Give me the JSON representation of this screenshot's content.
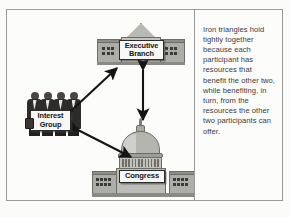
{
  "figure": {
    "title": "Iron Triangle",
    "caption": "Iron triangles hold tightly together because each participant has resources that benefit the other two, while benefiting, in turn, from the resources the other two participants can offer."
  },
  "diagram": {
    "type": "triangle-relationship",
    "nodes": [
      {
        "id": "executive",
        "label": "Executive\nBranch",
        "label_line1": "Executive",
        "label_line2": "Branch",
        "icon": "white-house-building"
      },
      {
        "id": "interest_group",
        "label": "Interest\nGroup",
        "label_line1": "Interest",
        "label_line2": "Group",
        "icon": "group-of-people"
      },
      {
        "id": "congress",
        "label": "Congress",
        "label_line1": "Congress",
        "icon": "capitol-building"
      }
    ],
    "connections": [
      {
        "from": "interest_group",
        "to": "executive",
        "style": "double-headed-arrow"
      },
      {
        "from": "executive",
        "to": "congress",
        "style": "double-headed-arrow"
      },
      {
        "from": "interest_group",
        "to": "congress",
        "style": "double-headed-arrow"
      }
    ]
  },
  "colors": {
    "frame_border": "#9a9a9a",
    "building_fill": "#bdbdb8",
    "building_outline": "#6d6d68",
    "arrow": "#151515",
    "plaque_background": "#f7f7f5",
    "caption_text": "#3b3b3b",
    "page_background": "#fbfbfa"
  }
}
